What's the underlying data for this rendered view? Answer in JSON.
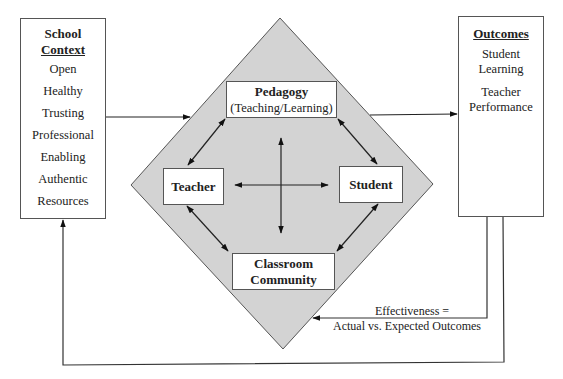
{
  "school_context": {
    "title_line1": "School",
    "title_line2": "Context",
    "items": [
      "Open",
      "Healthy",
      "Trusting",
      "Professional",
      "Enabling",
      "Authentic",
      "Resources"
    ]
  },
  "outcomes": {
    "title": "Outcomes",
    "items": [
      {
        "line1": "Student",
        "line2": "Learning"
      },
      {
        "line1": "Teacher",
        "line2": "Performance"
      }
    ]
  },
  "diamond": {
    "fill": "#d3d3d3",
    "nodes": {
      "pedagogy": {
        "title": "Pedagogy",
        "subtitle": "(Teaching/Learning)"
      },
      "teacher": {
        "title": "Teacher"
      },
      "student": {
        "title": "Student"
      },
      "classroom": {
        "line1": "Classroom",
        "line2": "Community"
      }
    }
  },
  "feedback": {
    "line1": "Effectiveness =",
    "line2": "Actual vs. Expected Outcomes"
  }
}
